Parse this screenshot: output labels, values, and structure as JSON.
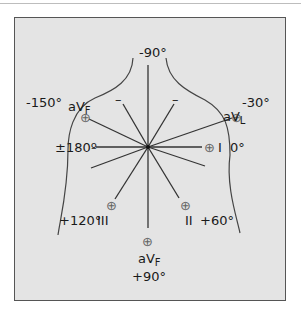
{
  "diagram": {
    "colors": {
      "background": "#e4e4e4",
      "lines": "#333333",
      "frame": "#555555"
    },
    "center": [
      148,
      147
    ],
    "angles": {
      "top": "-90°",
      "upper_left": "-150°",
      "upper_right": "-30°",
      "left": "±180º",
      "right": "0°",
      "lower_left": "+120°",
      "lower_right": "+60°",
      "bottom": "+90°"
    },
    "leads": {
      "upper_left": {
        "name": "aV",
        "sub": "F"
      },
      "upper_right": {
        "name": "aV",
        "sub": "L"
      },
      "right": {
        "name": "I"
      },
      "lower_right": {
        "name": "II"
      },
      "lower_left": {
        "name": "III"
      },
      "bottom": {
        "name": "aV",
        "sub": "F"
      }
    },
    "markers": {
      "positive": "⊕",
      "negative": "–"
    }
  }
}
